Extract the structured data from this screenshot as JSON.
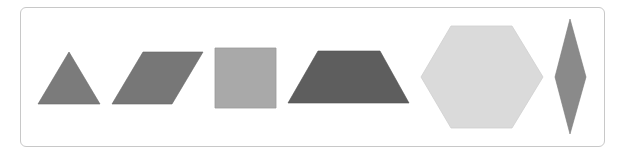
{
  "figure": {
    "shapes": [
      {
        "name": "triangle",
        "points": "69,52 100,104 38,104",
        "fill": "#7b7b7b"
      },
      {
        "name": "parallelogram",
        "points": "143,52 203,52 172,104 112,104",
        "fill": "#777777"
      },
      {
        "name": "square",
        "points": "215,48 276,48 276,108 215,108",
        "fill": "#a9a9a9"
      },
      {
        "name": "trapezoid",
        "points": "318,51 380,51 409,103 288,103",
        "fill": "#5e5e5e"
      },
      {
        "name": "hexagon",
        "points": "451,26 512,26 543,77 512,128 451,128 421,77",
        "fill": "#dadada"
      },
      {
        "name": "rhombus",
        "points": "570,19 586,77 570,134 555,77",
        "fill": "#8a8a8a"
      }
    ]
  }
}
